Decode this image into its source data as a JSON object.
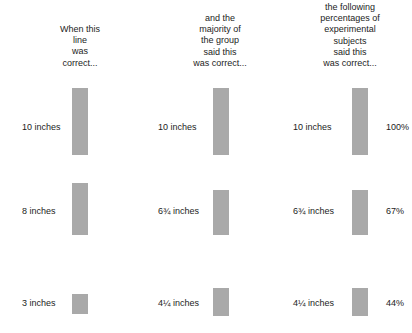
{
  "chart_data": {
    "type": "bar",
    "title": "",
    "xlabel": "",
    "ylabel": "",
    "grid": false,
    "legend": "none",
    "columns": [
      {
        "key": "standard",
        "header_lines": [
          "When this",
          "line",
          "was",
          "correct..."
        ],
        "values_in": [
          10,
          8,
          3
        ],
        "labels": [
          "10 inches",
          "8 inches",
          "3 inches"
        ]
      },
      {
        "key": "majority",
        "header_lines": [
          "and the",
          "majority of",
          "the group",
          "said this",
          "was correct..."
        ],
        "values_in": [
          10,
          6.75,
          4.25
        ],
        "labels": [
          "10 inches",
          "6¾ inches",
          "4¼ inches"
        ]
      },
      {
        "key": "subjects",
        "header_lines": [
          "the following",
          "percentages of",
          "experimental",
          "subjects",
          "said this",
          "was correct..."
        ],
        "values_in": [
          10,
          6.75,
          4.25
        ],
        "labels": [
          "10 inches",
          "6¾ inches",
          "4¼ inches"
        ],
        "percent_labels": [
          "100%",
          "67%",
          "44%"
        ],
        "percent_values": [
          100,
          67,
          44
        ]
      }
    ],
    "bar_color": "#a9a9a9",
    "background_color": "#ffffff"
  },
  "headers": {
    "col1": "When this\nline\nwas\ncorrect...",
    "col2": "and the\nmajority of\nthe group\nsaid this\nwas correct...",
    "col3": "the following\npercentages of\nexperimental\nsubjects\nsaid this\nwas correct..."
  },
  "rows": [
    {
      "col1_label": "10 inches",
      "col2_label": "10 inches",
      "col3_label": "10 inches",
      "percent": "100%"
    },
    {
      "col1_label": "8 inches",
      "col2_label": "6¾ inches",
      "col3_label": "6¾ inches",
      "percent": "67%"
    },
    {
      "col1_label": "3 inches",
      "col2_label": "4¼ inches",
      "col3_label": "4¼ inches",
      "percent": "44%"
    }
  ]
}
